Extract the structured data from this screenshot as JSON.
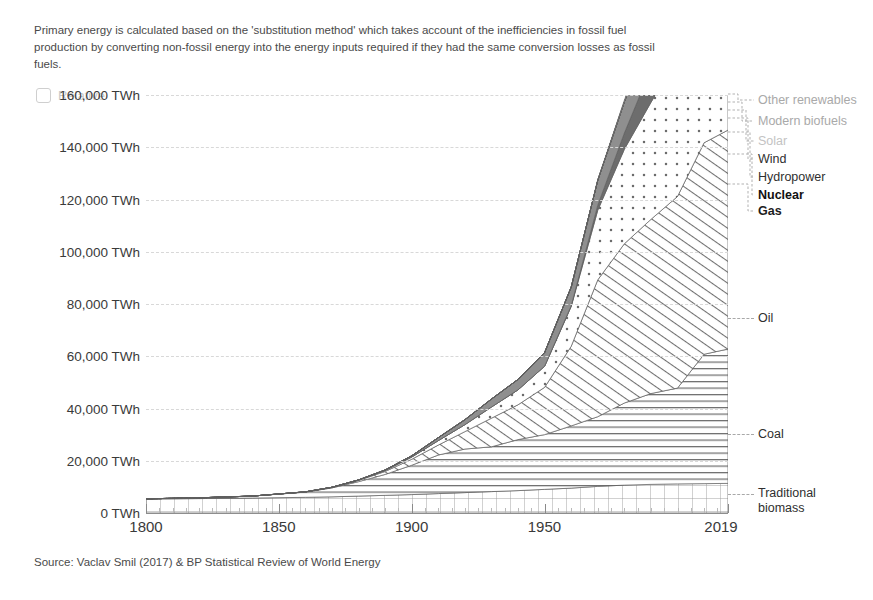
{
  "note": "Primary energy is calculated based on the 'substitution method' which takes account of the inefficiencies in fossil fuel production by converting non-fossil energy into the energy inputs required if they had the same conversion losses as fossil fuels.",
  "controls": {
    "relative_label": "Relative",
    "relative_checked": false
  },
  "source": "Source: Vaclav Smil (2017) & BP Statistical Review of World Energy",
  "chart_data": {
    "type": "area",
    "title": "",
    "subtitle": "",
    "xlabel": "",
    "ylabel": "",
    "grid": true,
    "legend_position": "right",
    "xlim": [
      1800,
      2019
    ],
    "ylim": [
      0,
      168000
    ],
    "y_ticks": [
      0,
      20000,
      40000,
      60000,
      80000,
      100000,
      120000,
      140000,
      160000
    ],
    "y_tick_labels": [
      "0 TWh",
      "20,000 TWh",
      "40,000 TWh",
      "60,000 TWh",
      "80,000 TWh",
      "100,000 TWh",
      "120,000 TWh",
      "140,000 TWh",
      "160,000 TWh"
    ],
    "x_ticks": [
      1800,
      1850,
      1900,
      1950,
      2019
    ],
    "x_tick_labels": [
      "1800",
      "1850",
      "1900",
      "1950",
      "2019"
    ],
    "x": [
      1800,
      1820,
      1840,
      1860,
      1870,
      1880,
      1890,
      1900,
      1910,
      1920,
      1930,
      1940,
      1950,
      1960,
      1970,
      1980,
      1990,
      2000,
      2010,
      2019
    ],
    "stack_order_bottom_to_top": [
      "Traditional biomass",
      "Coal",
      "Oil",
      "Gas",
      "Nuclear",
      "Hydropower",
      "Wind",
      "Solar",
      "Modern biofuels",
      "Other renewables"
    ],
    "series": [
      {
        "name": "Traditional biomass",
        "pattern": "grid",
        "label_color": "#2f2f2f",
        "values": [
          5600,
          5800,
          6000,
          6300,
          6500,
          6800,
          7100,
          7400,
          7800,
          8200,
          8600,
          9000,
          9500,
          10000,
          10700,
          11200,
          11500,
          11700,
          11800,
          11900
        ]
      },
      {
        "name": "Coal",
        "pattern": "horizontal-lines",
        "label_color": "#2f2f2f",
        "values": [
          100,
          300,
          800,
          2100,
          3600,
          5800,
          8400,
          11800,
          15500,
          17500,
          18000,
          20500,
          22000,
          25000,
          28000,
          33000,
          36500,
          38500,
          52000,
          54000
        ]
      },
      {
        "name": "Oil",
        "pattern": "diagonal-stripes",
        "label_color": "#2f2f2f",
        "values": [
          0,
          0,
          0,
          100,
          200,
          500,
          1200,
          2400,
          4000,
          7000,
          11500,
          14000,
          19000,
          32000,
          55000,
          64000,
          70000,
          77000,
          85000,
          88000
        ]
      },
      {
        "name": "Gas",
        "pattern": "dots",
        "label_color": "#2f2f2f",
        "values": [
          0,
          0,
          0,
          0,
          50,
          150,
          400,
          900,
          1800,
          2800,
          4500,
          6000,
          8500,
          16000,
          28000,
          38000,
          47000,
          56000,
          70000,
          79000
        ]
      },
      {
        "name": "Nuclear",
        "pattern": "solid-dark",
        "label_color": "#111111",
        "values": [
          0,
          0,
          0,
          0,
          0,
          0,
          0,
          0,
          0,
          0,
          0,
          0,
          0,
          300,
          2000,
          6500,
          13500,
          17000,
          17500,
          17000
        ]
      },
      {
        "name": "Hydropower",
        "pattern": "solid-mid",
        "label_color": "#2f2f2f",
        "values": [
          0,
          0,
          0,
          0,
          0,
          50,
          200,
          500,
          1200,
          2000,
          3200,
          4200,
          5500,
          7500,
          10000,
          12500,
          15500,
          18000,
          21500,
          24000
        ]
      },
      {
        "name": "Wind",
        "pattern": "light-lines",
        "label_color": "#2f2f2f",
        "values": [
          0,
          0,
          0,
          0,
          0,
          0,
          0,
          0,
          0,
          0,
          0,
          0,
          0,
          0,
          0,
          30,
          200,
          800,
          4000,
          9000
        ]
      },
      {
        "name": "Solar",
        "pattern": "very-light",
        "label_color": "#b8b8b8",
        "values": [
          0,
          0,
          0,
          0,
          0,
          0,
          0,
          0,
          0,
          0,
          0,
          0,
          0,
          0,
          0,
          0,
          10,
          60,
          800,
          6000
        ]
      },
      {
        "name": "Modern biofuels",
        "pattern": "very-light",
        "label_color": "#a9a9a9",
        "values": [
          0,
          0,
          0,
          0,
          0,
          0,
          0,
          0,
          0,
          0,
          0,
          0,
          0,
          0,
          0,
          50,
          250,
          700,
          2300,
          3200
        ]
      },
      {
        "name": "Other renewables",
        "pattern": "very-light",
        "label_color": "#a9a9a9",
        "values": [
          0,
          0,
          0,
          0,
          0,
          0,
          0,
          0,
          0,
          0,
          0,
          0,
          0,
          50,
          200,
          600,
          1300,
          2200,
          3200,
          4200
        ]
      }
    ],
    "callout_labels": [
      {
        "name": "Oil",
        "y_px": 318
      },
      {
        "name": "Coal",
        "y_px": 434
      },
      {
        "name": "Traditional biomass",
        "y_px": 494
      }
    ],
    "legend_labels": [
      "Other renewables",
      "Modern biofuels",
      "Solar",
      "Wind",
      "Hydropower",
      "Nuclear",
      "Gas"
    ]
  }
}
